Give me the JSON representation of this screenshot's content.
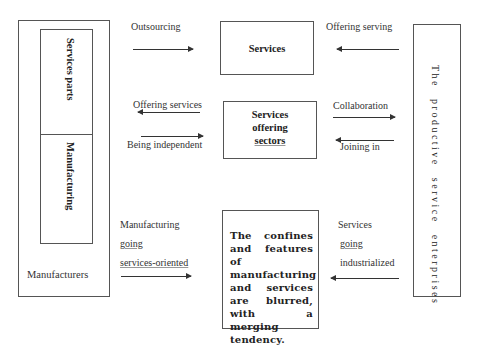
{
  "left": {
    "outer_label": "Manufacturers",
    "inner_top": "Services parts",
    "inner_bottom": "Manufacturing"
  },
  "right": {
    "label": "The productive service enterprises"
  },
  "top": {
    "box": "Services",
    "left_label": "Outsourcing",
    "right_label": "Offering serving"
  },
  "middle": {
    "box_lines": [
      "Services",
      "offering",
      "sectors"
    ],
    "left_top_label": "Offering services",
    "left_bottom_label": "Being independent",
    "right_top_label": "Collaboration",
    "right_bottom_label": "Joining in"
  },
  "bottom": {
    "box": "The confines and features of manufacturing and services are blurred, with a merging tendency.",
    "left_lines": [
      "Manufacturing",
      "going",
      "services-oriented"
    ],
    "right_lines": [
      "Services",
      "going",
      "industrialized"
    ]
  },
  "colors": {
    "line": "#333333",
    "border": "#555555",
    "background": "#ffffff"
  }
}
